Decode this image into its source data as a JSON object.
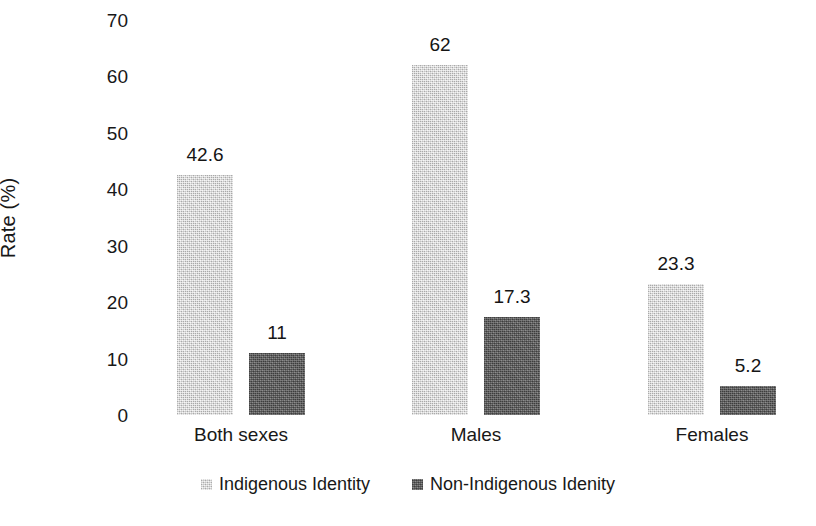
{
  "chart_data": {
    "type": "bar",
    "title": "",
    "subtitle": "",
    "xlabel": "",
    "ylabel": "Rate (%)",
    "ylim": [
      0,
      70
    ],
    "ytick_step": 10,
    "yticks": [
      "70",
      "60",
      "50",
      "40",
      "30",
      "20",
      "10",
      "0"
    ],
    "grid": false,
    "legend_position": "bottom-center",
    "categories": [
      "Both sexes",
      "Males",
      "Females"
    ],
    "series": [
      {
        "name": "Indigenous Identity",
        "color": "#c9c9c9",
        "values": [
          42.6,
          62,
          23.3
        ],
        "labels": [
          "42.6",
          "62",
          "23.3"
        ]
      },
      {
        "name": "Non-Indigenous Idenity",
        "color": "#585858",
        "values": [
          11,
          17.3,
          5.2
        ],
        "labels": [
          "11",
          "17.3",
          "5.2"
        ]
      }
    ]
  },
  "legend": {
    "items": [
      {
        "label": "Indigenous Identity",
        "color": "#c9c9c9"
      },
      {
        "label": "Non-Indigenous Idenity",
        "color": "#585858"
      }
    ]
  }
}
